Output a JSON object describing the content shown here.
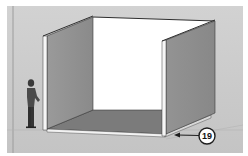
{
  "scene": {
    "type": "3d-modeling-viewport",
    "description": "Open box room model with scale figure",
    "colors": {
      "background": "#ffffff",
      "canvas": "#cfcfcf",
      "ground": "#c6c6c6",
      "wall_shaded": "#8f8f8f",
      "wall_back": "#ffffff",
      "floor": "#7a7a7a",
      "edge": "#3a3a3a",
      "wall_front_edge": "#f4f4f4"
    }
  },
  "callout": {
    "number": "19",
    "icon": "numbered-callout-circle"
  },
  "figure": {
    "icon": "scale-person-figure"
  }
}
